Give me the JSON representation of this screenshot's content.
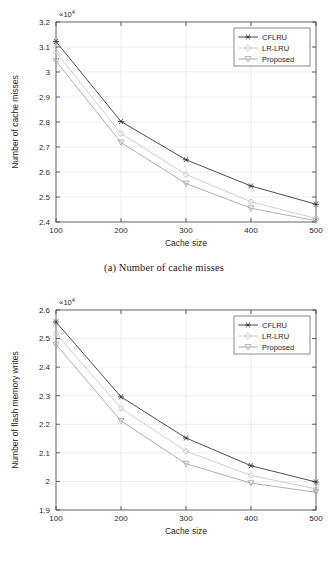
{
  "figure": {
    "panels": [
      {
        "id": "a",
        "caption": "(a) Number of cache misses",
        "chart_ref": 0
      },
      {
        "id": "b",
        "caption": "(b) Number of flash memory writes",
        "chart_ref": 1
      }
    ]
  },
  "chart_data": [
    {
      "type": "line",
      "title": "",
      "xlabel": "Cache size",
      "ylabel": "Number of cache misses",
      "y_exponent": "×10",
      "y_exponent_power": "4",
      "x": [
        100,
        200,
        300,
        400,
        500
      ],
      "xticks": [
        "100",
        "200",
        "300",
        "400",
        "500"
      ],
      "yticks": [
        "2.4",
        "2.5",
        "2.6",
        "2.7",
        "2.8",
        "2.9",
        "3",
        "3.1",
        "3.2"
      ],
      "xlim": [
        100,
        500
      ],
      "ylim": [
        2.4,
        3.2
      ],
      "grid": true,
      "legend_position": "top-right",
      "series": [
        {
          "name": "CFLRU",
          "marker": "asterisk",
          "color": "#3a3a3a",
          "values": [
            3.122,
            2.802,
            2.649,
            2.544,
            2.471
          ]
        },
        {
          "name": "LR-LRU",
          "marker": "circle",
          "color": "#c9c9c9",
          "values": [
            3.079,
            2.754,
            2.59,
            2.481,
            2.414
          ]
        },
        {
          "name": "Proposed",
          "marker": "triangle-down",
          "color": "#a8a8a8",
          "values": [
            3.044,
            2.718,
            2.554,
            2.455,
            2.405
          ]
        }
      ]
    },
    {
      "type": "line",
      "title": "",
      "xlabel": "Cache size",
      "ylabel": "Number of flash memory writes",
      "y_exponent": "×10",
      "y_exponent_power": "4",
      "x": [
        100,
        200,
        300,
        400,
        500
      ],
      "xticks": [
        "100",
        "200",
        "300",
        "400",
        "500"
      ],
      "yticks": [
        "1.9",
        "2",
        "2.1",
        "2.2",
        "2.3",
        "2.4",
        "2.5",
        "2.6"
      ],
      "xlim": [
        100,
        500
      ],
      "ylim": [
        1.9,
        2.6
      ],
      "grid": true,
      "legend_position": "top-right",
      "series": [
        {
          "name": "CFLRU",
          "marker": "asterisk",
          "color": "#3a3a3a",
          "values": [
            2.558,
            2.296,
            2.152,
            2.055,
            1.998
          ]
        },
        {
          "name": "LR-LRU",
          "marker": "circle",
          "color": "#c9c9c9",
          "values": [
            2.518,
            2.256,
            2.106,
            2.021,
            1.974
          ]
        },
        {
          "name": "Proposed",
          "marker": "triangle-down",
          "color": "#a8a8a8",
          "values": [
            2.479,
            2.212,
            2.062,
            1.994,
            1.962
          ]
        }
      ]
    }
  ]
}
